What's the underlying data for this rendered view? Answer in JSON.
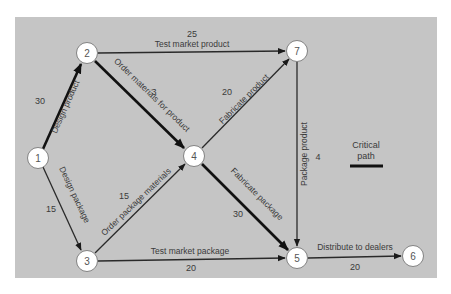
{
  "diagram": {
    "type": "PERT network",
    "nodes": [
      {
        "id": "1",
        "label": "1",
        "x": 38,
        "y": 158
      },
      {
        "id": "2",
        "label": "2",
        "x": 87,
        "y": 53
      },
      {
        "id": "3",
        "label": "3",
        "x": 87,
        "y": 261
      },
      {
        "id": "4",
        "label": "4",
        "x": 194,
        "y": 156
      },
      {
        "id": "5",
        "label": "5",
        "x": 297,
        "y": 258
      },
      {
        "id": "6",
        "label": "6",
        "x": 413,
        "y": 256
      },
      {
        "id": "7",
        "label": "7",
        "x": 297,
        "y": 51
      }
    ],
    "edges": [
      {
        "from": "1",
        "to": "2",
        "activity": "Design product",
        "duration": "30",
        "critical": true
      },
      {
        "from": "1",
        "to": "3",
        "activity": "Design package",
        "duration": "15",
        "critical": false
      },
      {
        "from": "2",
        "to": "7",
        "activity": "Test market product",
        "duration": "25",
        "critical": false
      },
      {
        "from": "2",
        "to": "4",
        "activity": "Order materials for product",
        "duration": "3",
        "critical": true
      },
      {
        "from": "3",
        "to": "4",
        "activity": "Order package materials",
        "duration": "15",
        "critical": false
      },
      {
        "from": "4",
        "to": "7",
        "activity": "Fabricate product",
        "duration": "20",
        "critical": false
      },
      {
        "from": "4",
        "to": "5",
        "activity": "Fabricate package",
        "duration": "30",
        "critical": true
      },
      {
        "from": "3",
        "to": "5",
        "activity": "Test market package",
        "duration": "20",
        "critical": false
      },
      {
        "from": "7",
        "to": "5",
        "activity": "Package product",
        "duration": "4",
        "critical": false
      },
      {
        "from": "5",
        "to": "6",
        "activity": "Distribute to dealers",
        "duration": "20",
        "critical": true
      }
    ],
    "legend": {
      "line1": "Critical",
      "line2": "path"
    },
    "colors": {
      "panel": "#c5c5c5",
      "node_fill": "#ffffff",
      "critical_edge": "#111111",
      "normal_edge": "#2a2a2a"
    }
  }
}
